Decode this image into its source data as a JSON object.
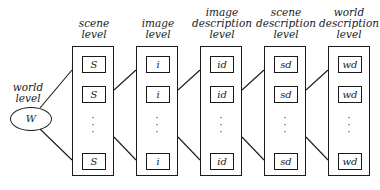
{
  "diagram": {
    "world": {
      "label_line1": "world",
      "label_line2": "level",
      "node": "W"
    },
    "columns": [
      {
        "title": [
          "",
          "scene",
          "level"
        ],
        "cell": "S",
        "ellipsis": "⋮"
      },
      {
        "title": [
          "",
          "image",
          "level"
        ],
        "cell": "i",
        "ellipsis": "⋮"
      },
      {
        "title": [
          "image",
          "description",
          "level"
        ],
        "cell": "id",
        "ellipsis": "⋮"
      },
      {
        "title": [
          "scene",
          "description",
          "level"
        ],
        "cell": "sd",
        "ellipsis": "⋮"
      },
      {
        "title": [
          "world",
          "description",
          "level"
        ],
        "cell": "wd",
        "ellipsis": "⋮"
      }
    ]
  }
}
